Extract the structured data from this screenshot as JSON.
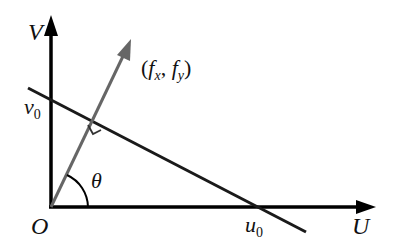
{
  "diagram": {
    "axes": {
      "x_label": "U",
      "y_label": "V",
      "origin_label": "O"
    },
    "intercepts": {
      "v0": "v",
      "v0_sub": "0",
      "u0": "u",
      "u0_sub": "0"
    },
    "vector": {
      "label_open": "(",
      "fx": "f",
      "fx_sub": "x",
      "sep": ", ",
      "fy": "f",
      "fy_sub": "y",
      "label_close": ")"
    },
    "angle_label": "θ",
    "colors": {
      "axis": "#000000",
      "line": "#1a1a1a",
      "vector": "#666666"
    }
  }
}
